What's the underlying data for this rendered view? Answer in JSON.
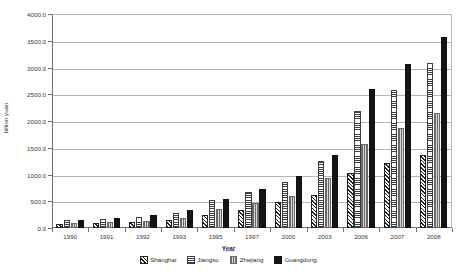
{
  "chart_data": {
    "type": "bar",
    "title": "",
    "xlabel": "Year",
    "ylabel": "billion yuan",
    "ylim": [
      0,
      4000
    ],
    "ytick_step": 500,
    "grid": true,
    "legend_position": "bottom",
    "categories": [
      "1990",
      "1991",
      "1992",
      "1993",
      "1995",
      "1997",
      "2000",
      "2003",
      "2006",
      "2007",
      "2008"
    ],
    "ytick_labels": [
      "0.0",
      "500.0",
      "1000.0",
      "1500.0",
      "2000.0",
      "2500.0",
      "3000.0",
      "3500.0",
      "4000.0"
    ],
    "series": [
      {
        "name": "Shanghai",
        "pattern": "diagonal-hatch",
        "values": [
          78,
          89,
          111,
          151,
          247,
          336,
          477,
          626,
          1030,
          1219,
          1370
        ]
      },
      {
        "name": "Jiangsu",
        "pattern": "horizontal-hatch",
        "values": [
          142,
          165,
          211,
          289,
          516,
          666,
          858,
          1246,
          2184,
          2576,
          3085
        ]
      },
      {
        "name": "Zhejiang",
        "pattern": "vertical-hatch",
        "values": [
          90,
          107,
          136,
          190,
          352,
          463,
          603,
          940,
          1578,
          1872,
          2148
        ]
      },
      {
        "name": "Guangdong",
        "pattern": "solid-black",
        "values": [
          155,
          189,
          244,
          335,
          538,
          731,
          966,
          1356,
          2595,
          3067,
          3570
        ]
      }
    ]
  },
  "legend": {
    "items": [
      {
        "label": "Shanghai"
      },
      {
        "label": "Jiangsu"
      },
      {
        "label": "Zhejiang"
      },
      {
        "label": "Guangdong"
      }
    ]
  },
  "axes": {
    "x_title": "Year",
    "y_title": "billion yuan"
  }
}
